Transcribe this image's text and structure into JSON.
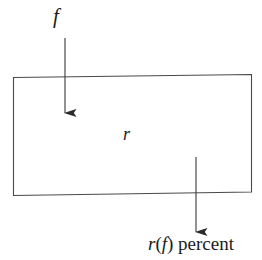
{
  "diagram": {
    "background_color": "#ffffff",
    "stroke_color": "#3a3a3a",
    "text_color": "#201c1c",
    "box": {
      "label": "r",
      "name": "transfer-function-box",
      "x": 13,
      "y": 76,
      "width": 239,
      "height": 119
    },
    "input_arrow": {
      "label": "f",
      "direction": "down",
      "x": 65,
      "y_start": 38,
      "y_end": 113
    },
    "output_arrow": {
      "direction": "down",
      "x": 196,
      "y_start": 157,
      "y_end": 232
    },
    "output_label": {
      "function": "r",
      "open_paren": "(",
      "argument": "f",
      "close_paren": ")",
      "unit": "percent",
      "full_text": "r(f) percent"
    }
  }
}
